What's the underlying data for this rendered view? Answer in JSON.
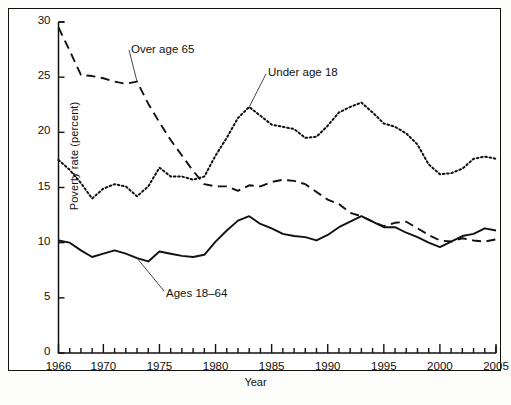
{
  "chart_data": {
    "type": "line",
    "title": "",
    "xlabel": "Year",
    "ylabel": "Poverty rate (percent)",
    "xlim": [
      1966,
      2005
    ],
    "ylim": [
      0,
      30
    ],
    "ytick_values": [
      0,
      5,
      10,
      15,
      20,
      25,
      30
    ],
    "ytick_labels": [
      "0",
      "5",
      "10",
      "15",
      "20",
      "25",
      "30"
    ],
    "xtick_major_values": [
      1966,
      1970,
      1975,
      1980,
      1985,
      1990,
      1995,
      2000,
      2005
    ],
    "xtick_major_labels": [
      "1966",
      "1970",
      "1975",
      "1980",
      "1985",
      "1990",
      "1995",
      "2000",
      "2005"
    ],
    "xtick_minor_step": 1,
    "grid": false,
    "legend_position": "inline-annotations",
    "x": [
      1966,
      1967,
      1968,
      1969,
      1970,
      1971,
      1972,
      1973,
      1974,
      1975,
      1976,
      1977,
      1978,
      1979,
      1980,
      1981,
      1982,
      1983,
      1984,
      1985,
      1986,
      1987,
      1988,
      1989,
      1990,
      1991,
      1992,
      1993,
      1994,
      1995,
      1996,
      1997,
      1998,
      1999,
      2000,
      2001,
      2002,
      2003,
      2004,
      2005
    ],
    "series": [
      {
        "name": "Over age 65",
        "style": "dashed",
        "color": "#111111",
        "values": [
          29.5,
          27.4,
          25.2,
          25.1,
          24.9,
          24.6,
          24.4,
          24.6,
          22.6,
          20.9,
          19.3,
          17.9,
          16.5,
          15.3,
          15.1,
          15.1,
          14.7,
          15.2,
          15.1,
          15.5,
          15.7,
          15.6,
          15.3,
          14.6,
          13.9,
          13.5,
          12.7,
          12.4,
          11.9,
          11.5,
          11.8,
          11.9,
          11.3,
          10.7,
          10.2,
          10.1,
          10.4,
          10.2,
          10.1,
          10.3
        ]
      },
      {
        "name": "Under age 18",
        "style": "dotted",
        "color": "#111111",
        "values": [
          17.5,
          16.6,
          15.4,
          14.0,
          14.9,
          15.3,
          15.1,
          14.2,
          15.1,
          16.8,
          16.0,
          16.0,
          15.7,
          16.0,
          17.9,
          19.5,
          21.3,
          22.3,
          21.5,
          20.7,
          20.5,
          20.3,
          19.5,
          19.6,
          20.6,
          21.8,
          22.3,
          22.7,
          21.8,
          20.8,
          20.5,
          19.9,
          18.9,
          17.1,
          16.2,
          16.3,
          16.7,
          17.6,
          17.8,
          17.6
        ]
      },
      {
        "name": "Ages 18–64",
        "style": "solid",
        "color": "#111111",
        "values": [
          10.2,
          10.0,
          9.3,
          8.7,
          9.0,
          9.3,
          9.0,
          8.6,
          8.3,
          9.2,
          9.0,
          8.8,
          8.7,
          8.9,
          10.1,
          11.1,
          12.0,
          12.4,
          11.7,
          11.3,
          10.8,
          10.6,
          10.5,
          10.2,
          10.7,
          11.4,
          11.9,
          12.4,
          11.9,
          11.4,
          11.4,
          10.9,
          10.5,
          10.0,
          9.6,
          10.1,
          10.6,
          10.8,
          11.3,
          11.1
        ]
      }
    ],
    "annotations": [
      {
        "text": "Over age 65",
        "series": "Over age 65",
        "anchor_year": 1973
      },
      {
        "text": "Under age 18",
        "series": "Under age 18",
        "anchor_year": 1983
      },
      {
        "text": "Ages 18–64",
        "series": "Ages 18–64",
        "anchor_year": 1973
      }
    ]
  },
  "axes": {
    "y_axis_label": "Poverty rate (percent)",
    "x_axis_label": "Year"
  }
}
